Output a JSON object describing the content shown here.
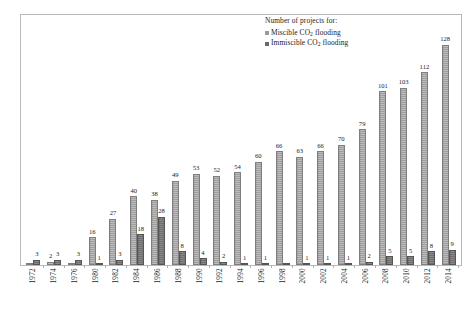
{
  "legend": {
    "title": "Number of projects for:",
    "entries": [
      {
        "label_pre": "Miscible CO",
        "label_sub": "2",
        "label_post": " flooding",
        "color": "#9a9a9a",
        "key": "miscible"
      },
      {
        "label_pre": "Immiscible CO",
        "label_sub": "2",
        "label_post": " flooding",
        "color": "#6a6a6a",
        "key": "immiscible"
      }
    ]
  },
  "chart_data": {
    "type": "bar",
    "title": "",
    "xlabel": "",
    "ylabel": "",
    "ylim": [
      0,
      140
    ],
    "grid": false,
    "legend_position": "top-right inside plot",
    "categories": [
      "1972",
      "1974",
      "1976",
      "1980",
      "1982",
      "1984",
      "1986",
      "1988",
      "1990",
      "1992",
      "1994",
      "1996",
      "1998",
      "2000",
      "2002",
      "2004",
      "2006",
      "2008",
      "2010",
      "2012",
      "2014"
    ],
    "series": [
      {
        "name": "Miscible CO2 flooding",
        "color": "#9a9a9a",
        "values": [
          null,
          2,
          null,
          16,
          27,
          40,
          38,
          49,
          53,
          52,
          54,
          60,
          66,
          63,
          66,
          70,
          79,
          101,
          103,
          112,
          128
        ],
        "labels": [
          "",
          "2",
          "",
          "16",
          "27",
          "40",
          "38",
          "49",
          "53",
          "52",
          "54",
          "60",
          "66",
          "63",
          "66",
          "70",
          "79",
          "101",
          "103",
          "112",
          "128"
        ]
      },
      {
        "name": "Immiscible CO2 flooding",
        "color": "#6a6a6a",
        "values": [
          3,
          3,
          3,
          1,
          3,
          18,
          28,
          8,
          4,
          2,
          1,
          1,
          null,
          1,
          1,
          1,
          2,
          5,
          5,
          8,
          9
        ],
        "labels": [
          "3",
          "3",
          "3",
          "1",
          "3",
          "18",
          "28",
          "8",
          "4",
          "2",
          "1",
          "1",
          "",
          "1",
          "1",
          "1",
          "2",
          "5",
          "5",
          "8",
          "9"
        ]
      }
    ]
  }
}
